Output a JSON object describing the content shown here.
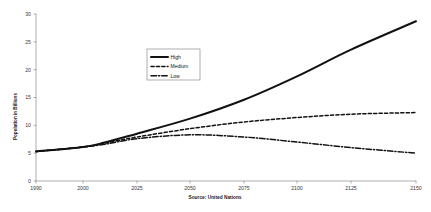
{
  "chart_data": {
    "type": "line",
    "title": "",
    "subtitle": "",
    "xlabel": "",
    "ylabel": "Population in Billions",
    "source_note": "Source: United Nations",
    "grid": false,
    "legend_position": "inside-upper-left",
    "xlim": [
      1990,
      2150
    ],
    "ylim": [
      0,
      30
    ],
    "x_tick_labels": [
      "1990",
      "2000",
      "2025",
      "2050",
      "2075",
      "2100",
      "2125",
      "2150"
    ],
    "x_ticks": [
      1990,
      2000,
      2025,
      2050,
      2075,
      2100,
      2125,
      2150
    ],
    "y_tick_labels": [
      "0",
      "5",
      "10",
      "15",
      "20",
      "25",
      "30"
    ],
    "y_ticks": [
      0,
      5,
      10,
      15,
      20,
      25,
      30
    ],
    "x": [
      1990,
      2000,
      2010,
      2025,
      2050,
      2075,
      2100,
      2125,
      2150
    ],
    "series": [
      {
        "name": "High",
        "style": "solid",
        "color": "#111111",
        "values": [
          5.3,
          6.1,
          6.9,
          8.5,
          11.2,
          14.6,
          18.8,
          23.6,
          28.7
        ]
      },
      {
        "name": "Medium",
        "style": "dashed",
        "color": "#111111",
        "values": [
          5.3,
          6.1,
          6.8,
          7.9,
          9.4,
          10.6,
          11.4,
          12.0,
          12.3
        ]
      },
      {
        "name": "Low",
        "style": "dash-dot",
        "color": "#111111",
        "values": [
          5.3,
          6.1,
          6.6,
          7.6,
          8.3,
          7.9,
          7.0,
          6.0,
          5.0
        ]
      }
    ]
  },
  "legend": {
    "entries": [
      {
        "label": "High"
      },
      {
        "label": "Medium"
      },
      {
        "label": "Low"
      }
    ]
  },
  "axes": {
    "y_title": "Population in Billions"
  },
  "footer": {
    "source": "Source: United Nations"
  }
}
